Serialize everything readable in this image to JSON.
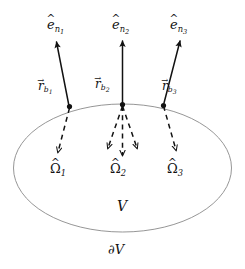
{
  "figure": {
    "colors": {
      "ink": "#121212",
      "boundary_curve": "#8a8a8a",
      "background": "#ffffff"
    },
    "region": {
      "volume_label": "V",
      "boundary_label": "∂V"
    },
    "normals": [
      {
        "id": "e-n1",
        "label_base": "e",
        "label_accent": "^",
        "subscript": "n",
        "subsubscript": "1",
        "text": "êₙ₁"
      },
      {
        "id": "e-n2",
        "label_base": "e",
        "label_accent": "^",
        "subscript": "n",
        "subsubscript": "2",
        "text": "êₙ₂"
      },
      {
        "id": "e-n3",
        "label_base": "e",
        "label_accent": "^",
        "subscript": "n",
        "subsubscript": "3",
        "text": "êₙ₃"
      }
    ],
    "boundary_points": [
      {
        "id": "r-b1",
        "label_base": "r",
        "label_accent": "→",
        "subscript": "b",
        "subsubscript": "1",
        "text": "r⃗_b1"
      },
      {
        "id": "r-b2",
        "label_base": "r",
        "label_accent": "→",
        "subscript": "b",
        "subsubscript": "2",
        "text": "r⃗_b2"
      },
      {
        "id": "r-b3",
        "label_base": "r",
        "label_accent": "→",
        "subscript": "b",
        "subsubscript": "3",
        "text": "r⃗_b3"
      }
    ],
    "directions": [
      {
        "id": "omega-1",
        "label_base": "Ω",
        "label_accent": "^",
        "subscript": "1",
        "text": "Ω̂1"
      },
      {
        "id": "omega-2",
        "label_base": "Ω",
        "label_accent": "^",
        "subscript": "2",
        "text": "Ω̂2"
      },
      {
        "id": "omega-3",
        "label_base": "Ω",
        "label_accent": "^",
        "subscript": "3",
        "text": "Ω̂3"
      }
    ]
  }
}
